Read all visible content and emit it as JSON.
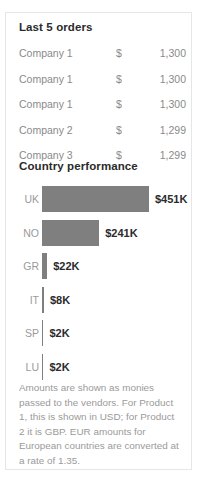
{
  "card": {
    "orders": {
      "title": "Last 5 orders",
      "rows": [
        {
          "company": "Company 1",
          "currency": "$",
          "amount": "1,300"
        },
        {
          "company": "Company 1",
          "currency": "$",
          "amount": "1,300"
        },
        {
          "company": "Company 1",
          "currency": "$",
          "amount": "1,300"
        },
        {
          "company": "Company 2",
          "currency": "$",
          "amount": "1,299"
        },
        {
          "company": "Company 3",
          "currency": "$",
          "amount": "1,299"
        }
      ]
    },
    "country_performance": {
      "title": "Country performance",
      "rows": [
        {
          "country": "UK",
          "value_label": "$451K"
        },
        {
          "country": "NO",
          "value_label": "$241K"
        },
        {
          "country": "GR",
          "value_label": "$22K"
        },
        {
          "country": "IT",
          "value_label": "$8K"
        },
        {
          "country": "SP",
          "value_label": "$2K"
        },
        {
          "country": "LU",
          "value_label": "$2K"
        }
      ]
    },
    "footnote": "Amounts are shown as monies passed to the vendors.  For Product 1, this is shown in USD; for Product 2 it is GBP.  EUR amounts for European countries are converted at a rate of 1.35."
  },
  "chart_data": {
    "type": "bar",
    "title": "Country performance",
    "orientation": "horizontal",
    "categories": [
      "UK",
      "NO",
      "GR",
      "IT",
      "SP",
      "LU"
    ],
    "values": [
      451,
      241,
      22,
      8,
      2,
      2
    ],
    "value_labels": [
      "$451K",
      "$241K",
      "$22K",
      "$8K",
      "$2K",
      "$2K"
    ],
    "unit": "thousands of USD",
    "xlabel": "",
    "ylabel": "",
    "xlim": [
      0,
      451
    ],
    "grid": false,
    "legend": "none",
    "bar_color": "#7f7f7f",
    "label_color": "#9a9a9a",
    "value_color": "#2b2b2b"
  },
  "style": {
    "bar_color": "#7f7f7f",
    "card_border": "#e6e6e6",
    "muted_text": "#9a9a9a",
    "dark_text": "#2b2b2b",
    "background": "#ffffff"
  }
}
